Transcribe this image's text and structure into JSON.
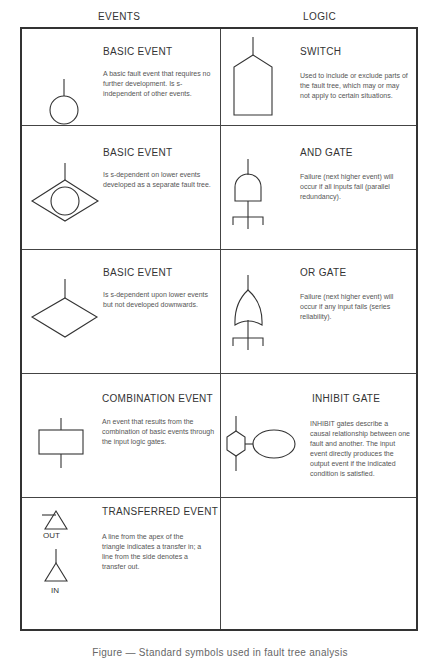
{
  "headers": {
    "events": "EVENTS",
    "logic": "LOGIC"
  },
  "rows": [
    {
      "event": {
        "title": "BASIC EVENT",
        "symbol": "circle-icon",
        "desc": "A basic fault event that requires no further development.  Is s-independent of other events."
      },
      "logic": {
        "title": "SWITCH",
        "symbol": "house-pentagon-icon",
        "desc": "Used to include or exclude parts of the fault tree, which may or may not apply to certain situations."
      }
    },
    {
      "event": {
        "title": "BASIC EVENT",
        "symbol": "circle-in-diamond-icon",
        "desc": "Is s-dependent on lower events developed as a separate fault tree."
      },
      "logic": {
        "title": "AND GATE",
        "symbol": "and-gate-icon",
        "desc": "Failure (next higher event) will occur if all inputs fail (parallel redundancy)."
      }
    },
    {
      "event": {
        "title": "BASIC EVENT",
        "symbol": "diamond-icon",
        "desc": "Is s-dependent upon lower events but not developed downwards."
      },
      "logic": {
        "title": "OR GATE",
        "symbol": "or-gate-icon",
        "desc": "Failure (next higher event) will occur if any input fails (series reliability)."
      }
    },
    {
      "event": {
        "title": "COMBINATION EVENT",
        "symbol": "rectangle-icon",
        "desc": "An event that results from the combination of basic events through the input logic gates."
      },
      "logic": {
        "title": "INHIBIT GATE",
        "symbol": "inhibit-gate-icon",
        "desc": "INHIBIT gates describe a causal relationship between one fault and another. The input event directly produces the output event if the indicated condition is satisfied."
      }
    },
    {
      "event": {
        "title": "TRANSFERRED EVENT",
        "symbol": "transfer-triangle-icon",
        "out_label": "OUT",
        "in_label": "IN",
        "desc": "A line from the apex of the triangle indicates a transfer in; a line from the side denotes a transfer out."
      },
      "logic": null
    }
  ],
  "caption": "Figure — Standard symbols used in fault tree analysis"
}
